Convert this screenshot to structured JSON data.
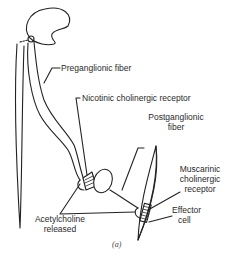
{
  "figure": {
    "caption": "(a)",
    "labels": {
      "preganglionic": "Preganglionic fiber",
      "nicotinic": "Nicotinic cholinergic receptor",
      "postganglionic_1": "Postganglionic",
      "postganglionic_2": "fiber",
      "muscarinic_1": "Muscarinic",
      "muscarinic_2": "cholinergic",
      "muscarinic_3": "receptor",
      "effector_1": "Effector",
      "effector_2": "cell",
      "ach_1": "Acetylcholine",
      "ach_2": "released"
    },
    "colors": {
      "line": "#222222",
      "text": "#2a2a2a",
      "background": "#ffffff"
    }
  }
}
